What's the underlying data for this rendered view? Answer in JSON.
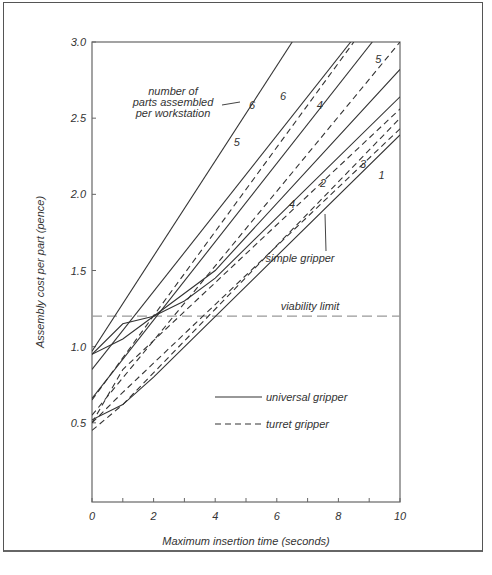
{
  "chart_data": {
    "type": "line",
    "title": "",
    "xlabel": "Maximum insertion time (seconds)",
    "ylabel": "Assembly cost per part (pence)",
    "xlim": [
      0,
      10
    ],
    "ylim": [
      0,
      3.0
    ],
    "xticks": [
      "0",
      "2",
      "4",
      "6",
      "8",
      "10"
    ],
    "yticks": [
      "0.5",
      "1.0",
      "1.5",
      "2.0",
      "2.5",
      "3.0"
    ],
    "grid": false,
    "legend": [
      {
        "label": "universal gripper",
        "style": "solid"
      },
      {
        "label": "turret gripper",
        "style": "dashed"
      }
    ],
    "annotations": {
      "parts_label": [
        "number of",
        "parts assembled",
        "per workstation"
      ],
      "simple_gripper": "simple gripper",
      "viability_limit": "viability limit",
      "viability_value": 1.2
    },
    "series": [
      {
        "name": "universal 6",
        "style": "solid",
        "x": [
          0,
          6.5
        ],
        "y": [
          0.97,
          3.0
        ]
      },
      {
        "name": "universal 5",
        "style": "solid",
        "x": [
          0,
          8.4
        ],
        "y": [
          0.85,
          3.0
        ]
      },
      {
        "name": "universal 4",
        "style": "solid",
        "x": [
          0,
          9.1
        ],
        "y": [
          0.66,
          3.0
        ]
      },
      {
        "name": "universal 3",
        "style": "solid",
        "x": [
          0,
          1,
          2,
          4,
          10
        ],
        "y": [
          0.95,
          1.05,
          1.2,
          1.5,
          2.82
        ]
      },
      {
        "name": "universal 2",
        "style": "solid",
        "x": [
          0,
          1,
          2,
          3,
          4,
          10
        ],
        "y": [
          0.95,
          1.15,
          1.2,
          1.3,
          1.45,
          2.64
        ]
      },
      {
        "name": "universal 1 (simple gripper)",
        "style": "solid",
        "x": [
          0,
          1,
          2,
          10
        ],
        "y": [
          0.52,
          0.62,
          0.8,
          2.39
        ]
      },
      {
        "name": "turret 6",
        "style": "dashed",
        "x": [
          0,
          8.5
        ],
        "y": [
          0.65,
          3.0
        ]
      },
      {
        "name": "turret 5",
        "style": "dashed",
        "x": [
          0,
          10
        ],
        "y": [
          0.55,
          3.0
        ]
      },
      {
        "name": "turret 4",
        "style": "dashed",
        "x": [
          0,
          1,
          10
        ],
        "y": [
          0.5,
          0.85,
          2.56
        ]
      },
      {
        "name": "turret 3",
        "style": "dashed",
        "x": [
          0,
          1,
          10
        ],
        "y": [
          0.5,
          0.7,
          2.43
        ]
      },
      {
        "name": "turret 2",
        "style": "dashed",
        "x": [
          0,
          1,
          10
        ],
        "y": [
          0.45,
          0.62,
          2.5
        ]
      }
    ],
    "line_labels": [
      {
        "text": "6",
        "x": 6.1,
        "y": 2.62
      },
      {
        "text": "5",
        "x": 4.6,
        "y": 2.32
      },
      {
        "text": "6",
        "x": 5.1,
        "y": 2.56
      },
      {
        "text": "4",
        "x": 7.3,
        "y": 2.56
      },
      {
        "text": "5",
        "x": 9.2,
        "y": 2.86
      },
      {
        "text": "3",
        "x": 8.7,
        "y": 2.17
      },
      {
        "text": "2",
        "x": 7.4,
        "y": 2.05
      },
      {
        "text": "1",
        "x": 9.3,
        "y": 2.1
      },
      {
        "text": "4",
        "x": 6.4,
        "y": 1.91
      }
    ]
  }
}
